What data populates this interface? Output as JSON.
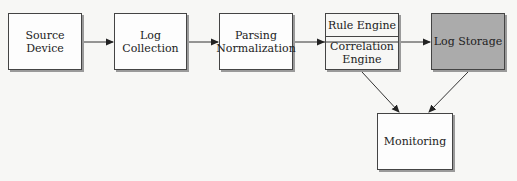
{
  "diagram": {
    "type": "flowchart",
    "nodes": [
      {
        "id": "source",
        "label": "Source Device"
      },
      {
        "id": "collection",
        "label": "Log Collection"
      },
      {
        "id": "parsing",
        "label_line1": "Parsing",
        "label_line2": "Normalization"
      },
      {
        "id": "engine",
        "label_top": "Rule Engine",
        "label_bottom_line1": "Correlation",
        "label_bottom_line2": "Engine"
      },
      {
        "id": "storage",
        "label": "Log Storage",
        "fill": "#ababab"
      },
      {
        "id": "monitoring",
        "label": "Monitoring"
      }
    ],
    "edges": [
      {
        "from": "source",
        "to": "collection"
      },
      {
        "from": "collection",
        "to": "parsing"
      },
      {
        "from": "parsing",
        "to": "storage",
        "passes_through": "engine"
      },
      {
        "from": "engine",
        "to": "monitoring"
      },
      {
        "from": "storage",
        "to": "monitoring"
      }
    ]
  }
}
